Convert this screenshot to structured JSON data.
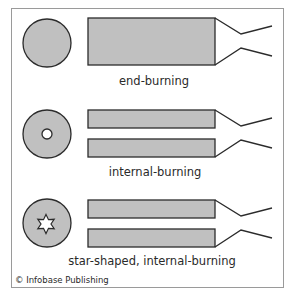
{
  "figure": {
    "credit": "© Infobase Publishing",
    "colors": {
      "fill": "#c0c0c0",
      "stroke": "#2b2b2b",
      "frame": "#9a9a9a",
      "background": "#ffffff"
    },
    "rows": [
      {
        "id": "end-burning",
        "label": "end-burning",
        "cross_section": "solid-circle",
        "grain": "single-bar"
      },
      {
        "id": "internal-burning",
        "label": "internal-burning",
        "cross_section": "circle-with-round-hole",
        "grain": "split-bars"
      },
      {
        "id": "star-shaped",
        "label": "star-shaped, internal-burning",
        "cross_section": "circle-with-star-hole",
        "grain": "split-bars"
      }
    ]
  }
}
